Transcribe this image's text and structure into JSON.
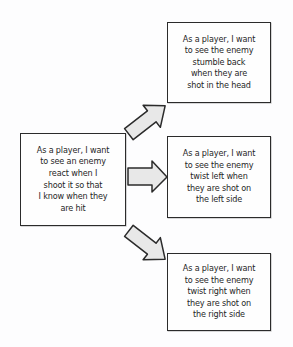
{
  "diagram": {
    "background_color": "#fdfdfe",
    "box_border_color": "#2b2b2b",
    "arrow_fill_color": "#e8e8e8",
    "arrow_stroke_color": "#2b2b2b",
    "text_color": "#262626",
    "parent": {
      "id": "parent-story",
      "text": "As a player, I want\nto see an enemy\nreact when I\nshoot it so that\nI know when they\nare hit"
    },
    "children": [
      {
        "id": "story-head-shot",
        "text": "As a player, I want\nto see the enemy\nstumble back\nwhen they are\nshot in the head"
      },
      {
        "id": "story-left-side",
        "text": "As a player, I want\nto see the enemy\ntwist left when\nthey are shot on\nthe left side"
      },
      {
        "id": "story-right-side",
        "text": "As a player, I want\nto see the enemy\ntwist right when\nthey are shot on\nthe right side"
      }
    ],
    "arrows": [
      {
        "id": "arrow-up-right",
        "direction": "up-right",
        "from": "parent-story",
        "to": "story-head-shot"
      },
      {
        "id": "arrow-right",
        "direction": "right",
        "from": "parent-story",
        "to": "story-left-side"
      },
      {
        "id": "arrow-down-right",
        "direction": "down-right",
        "from": "parent-story",
        "to": "story-right-side"
      }
    ]
  }
}
